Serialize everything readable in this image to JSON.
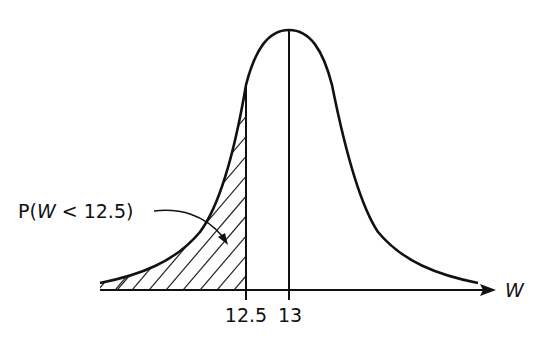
{
  "diagram": {
    "type": "normal-distribution-curve",
    "axis_label": "W",
    "mean_label": "13",
    "cutoff_label": "12.5",
    "annotation": {
      "prefix": "P(",
      "variable": "W",
      "suffix": " < 12.5)"
    },
    "shaded_region": "left tail, W < 12.5",
    "colors": {
      "stroke": "#111111",
      "background": "#ffffff"
    }
  }
}
